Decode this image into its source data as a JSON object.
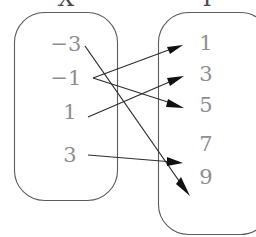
{
  "diagram": {
    "type": "mapping-diagram",
    "title_visible": false,
    "domain_set": {
      "label": "X",
      "label_clipped": true,
      "elements": [
        "−3",
        "−1",
        "1",
        "3"
      ]
    },
    "codomain_set": {
      "label": "Y",
      "label_clipped": true,
      "elements": [
        "1",
        "3",
        "5",
        "7",
        "9"
      ]
    },
    "mappings": [
      {
        "from": "−3",
        "to": "9"
      },
      {
        "from": "−1",
        "to": "1"
      },
      {
        "from": "−1",
        "to": "5"
      },
      {
        "from": "1",
        "to": "3"
      },
      {
        "from": "3",
        "to": "7"
      }
    ],
    "colors": {
      "element_text": "#8e8e8e",
      "box_stroke": "#5c5c5c",
      "arrow": "#2e2e2e",
      "label_text": "#4a4a4a",
      "background": "#ffffff"
    }
  }
}
